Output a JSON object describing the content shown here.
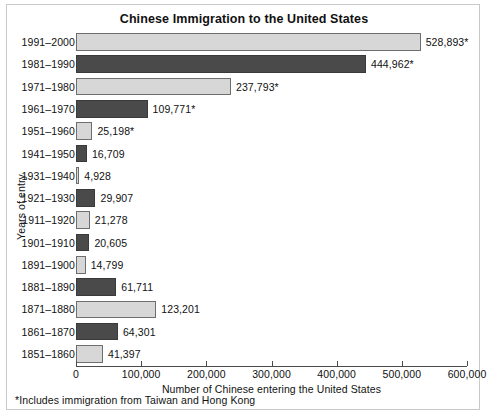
{
  "chart_data": {
    "type": "bar",
    "orientation": "horizontal",
    "title": "Chinese Immigration to the United States",
    "xlabel": "Number of Chinese entering the United States",
    "ylabel": "Years of entry",
    "xlim": [
      0,
      600000
    ],
    "xticks": [
      0,
      100000,
      200000,
      300000,
      400000,
      500000,
      600000
    ],
    "xtick_labels": [
      "0",
      "100,000",
      "200,000",
      "300,000",
      "400,000",
      "500,000",
      "600,000"
    ],
    "grid": false,
    "legend": "none",
    "footnote": "*Includes immigration from Taiwan and Hong Kong",
    "categories": [
      "1991–2000",
      "1981–1990",
      "1971–1980",
      "1961–1970",
      "1951–1960",
      "1941–1950",
      "1931–1940",
      "1921–1930",
      "1911–1920",
      "1901–1910",
      "1891–1900",
      "1881–1890",
      "1871–1880",
      "1861–1870",
      "1851–1860"
    ],
    "values": [
      528893,
      444962,
      237793,
      109771,
      25198,
      16709,
      4928,
      29907,
      21278,
      20605,
      14799,
      61711,
      123201,
      64301,
      41397
    ],
    "data_labels": [
      "528,893*",
      "444,962*",
      "237,793*",
      "109,771*",
      "25,198*",
      "16,709",
      "4,928",
      "29,907",
      "21,278",
      "20,605",
      "14,799",
      "61,711",
      "123,201",
      "64,301",
      "41,397"
    ],
    "bar_styles": [
      "light",
      "dark",
      "light",
      "dark",
      "light",
      "dark",
      "light",
      "dark",
      "light",
      "dark",
      "light",
      "dark",
      "light",
      "dark",
      "light"
    ],
    "colors": {
      "light": "#d7d7d7",
      "dark": "#4a4a4a",
      "bar_outline": "#6e6e6e",
      "axis": "#4a4a4a",
      "text": "#111111",
      "frame": "#c9c9c9"
    }
  }
}
